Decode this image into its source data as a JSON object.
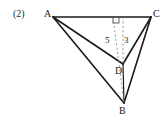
{
  "figure": {
    "problem_number": "(2)",
    "vertices": {
      "a": "A",
      "b": "B",
      "c": "C",
      "d": "D"
    },
    "measures": {
      "left_segment": "5",
      "right_segment": "3"
    },
    "colors": {
      "stroke": "#1a1a1a",
      "dashed_stroke": "#8c8c8c",
      "background": "#ffffff"
    },
    "markers": {
      "right_angle": "right-angle-marker"
    },
    "geometry": {
      "point_a": [
        53,
        17
      ],
      "point_c": [
        151,
        17
      ],
      "point_d": [
        123,
        64
      ],
      "point_b": [
        124,
        103
      ],
      "foot_left": [
        113,
        17
      ],
      "foot_right": [
        123,
        17
      ]
    }
  }
}
